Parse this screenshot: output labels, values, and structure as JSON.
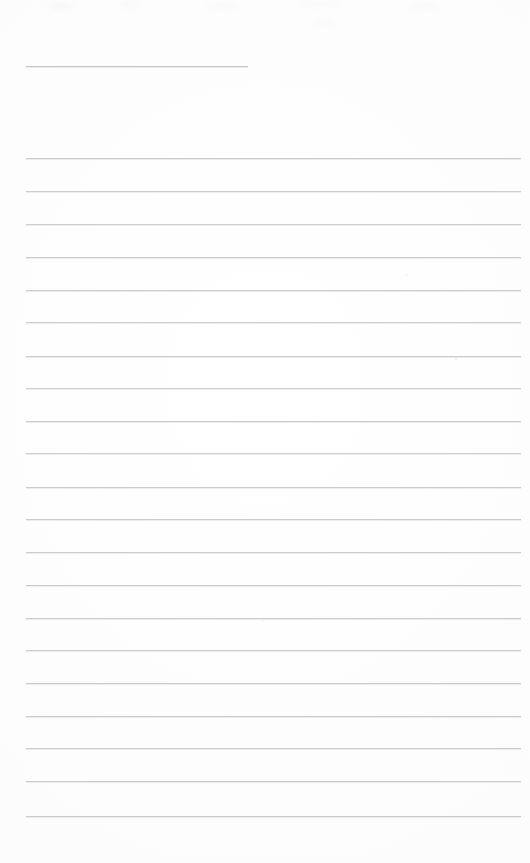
{
  "document": {
    "type": "scanned-lined-paper",
    "title": "Blank ruled notebook page",
    "description": "A scanned sheet of blank lined writing paper with no handwriting or printed text.",
    "page_width": 530,
    "page_height": 863,
    "background_color": "#fdfdfd",
    "rule_color": "#c9c9cb",
    "text_content": "",
    "visible_text": []
  },
  "rules": {
    "count": 22,
    "left_margin_x": 26,
    "right_margin_x": 521,
    "line_spacing": 32.7,
    "lines": [
      {
        "index": 1,
        "y": 66,
        "x1": 26,
        "x2": 248,
        "variant": "short",
        "opacity": 0.95
      },
      {
        "index": 2,
        "y": 158,
        "x1": 26,
        "x2": 521,
        "variant": "full",
        "opacity": 0.95
      },
      {
        "index": 3,
        "y": 191,
        "x1": 26,
        "x2": 521,
        "variant": "full",
        "opacity": 0.92
      },
      {
        "index": 4,
        "y": 224,
        "x1": 26,
        "x2": 521,
        "variant": "full",
        "opacity": 0.9
      },
      {
        "index": 5,
        "y": 257,
        "x1": 26,
        "x2": 521,
        "variant": "full",
        "opacity": 0.95
      },
      {
        "index": 6,
        "y": 290,
        "x1": 26,
        "x2": 521,
        "variant": "full",
        "opacity": 0.95
      },
      {
        "index": 7,
        "y": 322,
        "x1": 26,
        "x2": 521,
        "variant": "full",
        "opacity": 0.9
      },
      {
        "index": 8,
        "y": 356,
        "x1": 26,
        "x2": 521,
        "variant": "full",
        "opacity": 0.95
      },
      {
        "index": 9,
        "y": 388,
        "x1": 26,
        "x2": 521,
        "variant": "full",
        "opacity": 0.88
      },
      {
        "index": 10,
        "y": 421,
        "x1": 26,
        "x2": 521,
        "variant": "full",
        "opacity": 0.95
      },
      {
        "index": 11,
        "y": 453,
        "x1": 26,
        "x2": 521,
        "variant": "full",
        "opacity": 0.9
      },
      {
        "index": 12,
        "y": 487,
        "x1": 26,
        "x2": 521,
        "variant": "full",
        "opacity": 0.95
      },
      {
        "index": 13,
        "y": 519,
        "x1": 26,
        "x2": 521,
        "variant": "full",
        "opacity": 0.95
      },
      {
        "index": 14,
        "y": 552,
        "x1": 26,
        "x2": 521,
        "variant": "full",
        "opacity": 0.92
      },
      {
        "index": 15,
        "y": 585,
        "x1": 26,
        "x2": 521,
        "variant": "full",
        "opacity": 0.95
      },
      {
        "index": 16,
        "y": 618,
        "x1": 26,
        "x2": 521,
        "variant": "full",
        "opacity": 0.95
      },
      {
        "index": 17,
        "y": 650,
        "x1": 26,
        "x2": 521,
        "variant": "full",
        "opacity": 0.92
      },
      {
        "index": 18,
        "y": 683,
        "x1": 26,
        "x2": 521,
        "variant": "full",
        "opacity": 0.95
      },
      {
        "index": 19,
        "y": 716,
        "x1": 26,
        "x2": 521,
        "variant": "full",
        "opacity": 0.95
      },
      {
        "index": 20,
        "y": 748,
        "x1": 26,
        "x2": 521,
        "variant": "full",
        "opacity": 0.92
      },
      {
        "index": 21,
        "y": 781,
        "x1": 26,
        "x2": 521,
        "variant": "full",
        "opacity": 0.95
      },
      {
        "index": 22,
        "y": 816,
        "x1": 26,
        "x2": 521,
        "variant": "full",
        "opacity": 0.95
      }
    ]
  },
  "artifacts": {
    "specks": [
      {
        "x": 455,
        "y": 358,
        "size": 2,
        "opacity": 0.55
      },
      {
        "x": 406,
        "y": 274,
        "size": 1.5,
        "opacity": 0.35
      },
      {
        "x": 262,
        "y": 620,
        "size": 1.5,
        "opacity": 0.3
      }
    ],
    "smudges": [
      {
        "x": 48,
        "y": 2,
        "w": 26,
        "h": 8,
        "opacity": 0.6
      },
      {
        "x": 118,
        "y": 1,
        "w": 22,
        "h": 7,
        "opacity": 0.5
      },
      {
        "x": 205,
        "y": 2,
        "w": 34,
        "h": 8,
        "opacity": 0.5
      },
      {
        "x": 300,
        "y": 1,
        "w": 40,
        "h": 7,
        "opacity": 0.45
      },
      {
        "x": 410,
        "y": 2,
        "w": 30,
        "h": 8,
        "opacity": 0.5
      },
      {
        "x": 312,
        "y": 18,
        "w": 24,
        "h": 10,
        "opacity": 0.4
      }
    ]
  }
}
